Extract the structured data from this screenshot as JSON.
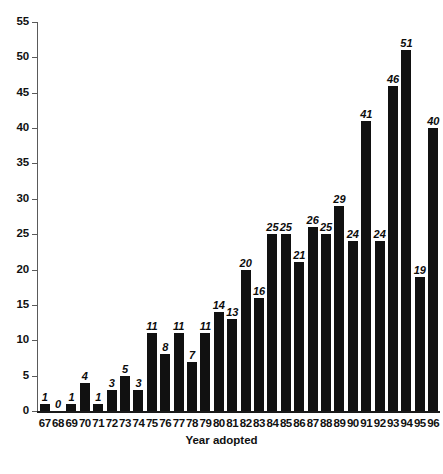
{
  "chart_data": {
    "type": "bar",
    "title": "",
    "subtitle": "",
    "xlabel": "Year adopted",
    "ylabel": "",
    "categories": [
      "67",
      "68",
      "69",
      "70",
      "71",
      "72",
      "73",
      "74",
      "75",
      "76",
      "77",
      "78",
      "79",
      "80",
      "81",
      "82",
      "83",
      "84",
      "85",
      "86",
      "87",
      "88",
      "89",
      "90",
      "91",
      "92",
      "93",
      "94",
      "95",
      "96"
    ],
    "values": [
      1,
      0,
      1,
      4,
      1,
      3,
      5,
      3,
      11,
      8,
      11,
      7,
      11,
      14,
      13,
      20,
      16,
      25,
      25,
      21,
      26,
      25,
      29,
      24,
      41,
      24,
      46,
      51,
      19,
      40
    ],
    "data_labels": [
      "1",
      "0",
      "1",
      "4",
      "1",
      "3",
      "5",
      "3",
      "11",
      "8",
      "11",
      "7",
      "11",
      "14",
      "13",
      "20",
      "16",
      "25",
      "25",
      "21",
      "26",
      "25",
      "29",
      "24",
      "41",
      "24",
      "46",
      "51",
      "19",
      "40"
    ],
    "ylim": [
      0,
      55
    ],
    "ytick_step": 5,
    "yticks": [
      "0",
      "5",
      "10",
      "15",
      "20",
      "25",
      "30",
      "35",
      "40",
      "45",
      "50",
      "55"
    ],
    "grid": false,
    "legend": null,
    "bar_color": "#111111",
    "axis_color": "#5a5a5a",
    "series": [
      {
        "name": "Number of adoptions",
        "values": [
          1,
          0,
          1,
          4,
          1,
          3,
          5,
          3,
          11,
          8,
          11,
          7,
          11,
          14,
          13,
          20,
          16,
          25,
          25,
          21,
          26,
          25,
          29,
          24,
          41,
          24,
          46,
          51,
          19,
          40
        ]
      }
    ]
  },
  "figure": {
    "caption": ""
  }
}
